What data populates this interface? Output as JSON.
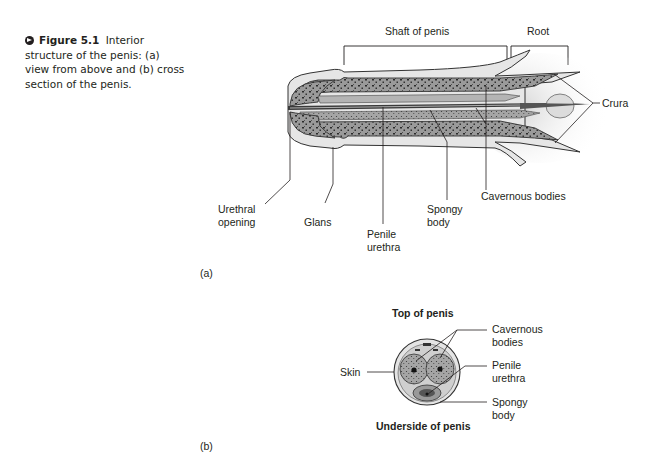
{
  "caption": {
    "icon": "arrow-circle-icon",
    "figure_number": "Figure 5.1",
    "text": "Interior structure of the penis: (a) view from above and (b) cross section of the penis."
  },
  "panel_a": {
    "panel_label": "(a)",
    "brackets": {
      "shaft": "Shaft of penis",
      "root": "Root"
    },
    "labels": {
      "crura": "Crura",
      "urethral_opening_1": "Urethral",
      "urethral_opening_2": "opening",
      "glans": "Glans",
      "penile_urethra_1": "Penile",
      "penile_urethra_2": "urethra",
      "spongy_body_1": "Spongy",
      "spongy_body_2": "body",
      "cavernous_bodies": "Cavernous bodies"
    }
  },
  "panel_b": {
    "panel_label": "(b)",
    "top_label": "Top of penis",
    "bottom_label": "Underside of penis",
    "labels": {
      "skin": "Skin",
      "cavernous_bodies_1": "Cavernous",
      "cavernous_bodies_2": "bodies",
      "penile_urethra_1": "Penile",
      "penile_urethra_2": "urethra",
      "spongy_body_1": "Spongy",
      "spongy_body_2": "body"
    }
  },
  "colors": {
    "ink": "#231f20",
    "tissue": "#8c8c8c",
    "tissue_light": "#c8c8c8",
    "skin": "#e2e2e2"
  }
}
